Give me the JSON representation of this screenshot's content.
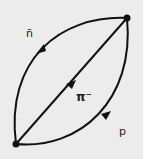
{
  "diagram": {
    "type": "feynman-loop",
    "labels": {
      "antineutron": "n̄",
      "pion": "π⁻",
      "proton": "p"
    },
    "colors": {
      "line": "#111111",
      "background": "#ececec"
    }
  }
}
